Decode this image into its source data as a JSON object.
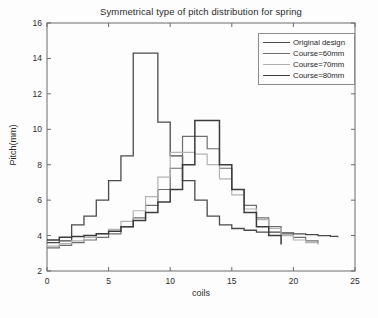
{
  "chart_data": {
    "type": "line",
    "subtype": "stairs",
    "title": "Symmetrical type of pitch distribution for spring",
    "xlabel": "coils",
    "ylabel": "Pitch(mm)",
    "xlim": [
      0,
      25
    ],
    "ylim": [
      2,
      16
    ],
    "xticks": [
      0,
      5,
      10,
      15,
      20,
      25
    ],
    "yticks": [
      2,
      4,
      6,
      8,
      10,
      12,
      14,
      16
    ],
    "grid": false,
    "legend_position": "top-right",
    "series": [
      {
        "name": "Original design",
        "color": "#4a4a4a",
        "linewidth": 1.3,
        "x": [
          0,
          1,
          2,
          3,
          4,
          5,
          6,
          7,
          8,
          9,
          10,
          11,
          12,
          13,
          14,
          15,
          16,
          17,
          18,
          19,
          20,
          21,
          22,
          23,
          23.6
        ],
        "values": [
          3.6,
          3.7,
          4.6,
          5.1,
          6.0,
          7.1,
          8.5,
          14.3,
          14.3,
          10.4,
          8.5,
          7.1,
          6.0,
          5.1,
          4.6,
          4.4,
          4.3,
          4.2,
          4.2,
          4.15,
          4.1,
          4.05,
          4.0,
          3.95,
          3.9
        ]
      },
      {
        "name": "Course=60mm",
        "color": "#6e6e6e",
        "linewidth": 1.2,
        "x": [
          0,
          1,
          2,
          3,
          4,
          5,
          6,
          7,
          8,
          9,
          10,
          11,
          12,
          13,
          14,
          15,
          16,
          17,
          18,
          19,
          20,
          21,
          22
        ],
        "values": [
          3.3,
          3.45,
          3.6,
          3.75,
          3.9,
          4.1,
          4.5,
          5.0,
          5.7,
          6.6,
          7.8,
          9.6,
          9.6,
          8.9,
          7.8,
          6.6,
          5.7,
          5.0,
          4.5,
          4.1,
          3.9,
          3.7,
          3.55
        ]
      },
      {
        "name": "Course=70mm",
        "color": "#b2b2b2",
        "linewidth": 1.2,
        "x": [
          0,
          1,
          2,
          3,
          4,
          5,
          6,
          7,
          8,
          9,
          10,
          11,
          12,
          13,
          14,
          15,
          16,
          17,
          18,
          19,
          20,
          21,
          22
        ],
        "values": [
          3.4,
          3.55,
          3.7,
          3.9,
          4.1,
          4.35,
          4.8,
          5.4,
          6.2,
          7.3,
          8.7,
          8.7,
          8.6,
          8.0,
          7.2,
          6.3,
          5.5,
          4.9,
          4.4,
          4.0,
          3.75,
          3.6,
          3.5
        ]
      },
      {
        "name": "Course=80mm",
        "color": "#3c3c3c",
        "linewidth": 1.5,
        "x": [
          0,
          1,
          2,
          3,
          4,
          5,
          6,
          7,
          8,
          9,
          10,
          11,
          12,
          13,
          14,
          15,
          16,
          17,
          18,
          19
        ],
        "values": [
          3.75,
          3.9,
          3.95,
          4.0,
          4.1,
          4.25,
          4.5,
          4.85,
          5.3,
          5.9,
          6.6,
          8.0,
          10.5,
          10.5,
          8.0,
          6.6,
          5.3,
          4.5,
          4.0,
          3.5
        ]
      }
    ]
  },
  "legend": {
    "entries": [
      {
        "label": "Original design"
      },
      {
        "label": "Course=60mm"
      },
      {
        "label": "Course=70mm"
      },
      {
        "label": "Course=80mm"
      }
    ]
  },
  "axes": {
    "frame_color": "#6a6a6a",
    "tick_color": "#6a6a6a"
  }
}
